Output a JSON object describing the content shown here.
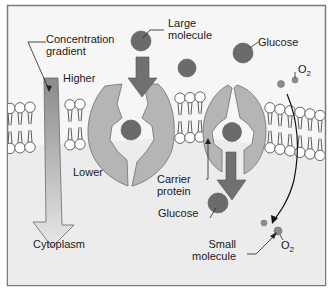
{
  "labels": {
    "concentration_gradient": "Concentration\ngradient",
    "higher": "Higher",
    "lower": "Lower",
    "large_molecule": "Large\nmolecule",
    "glucose_top": "Glucose",
    "o2_top": "O",
    "o2_top_sub": "2",
    "carrier_protein": "Carrier\nprotein",
    "glucose_bottom": "Glucose",
    "cytoplasm": "Cytoplasm",
    "small_molecule": "Small\nmolecule",
    "o2_bottom": "O",
    "o2_bottom_sub": "2"
  },
  "colors": {
    "background": "#f4f4f4",
    "inside": "#ededed",
    "frame": "#7a7a7a",
    "protein": "#b5b5b5",
    "protein_channel": "#f2f2f2",
    "molecule": "#6b6b6b",
    "small_molecule": "#8c8c8c",
    "arrow": "#6e6e6e",
    "gradient_top": "#8a8a8a",
    "gradient_bottom": "#e6e6e6"
  }
}
